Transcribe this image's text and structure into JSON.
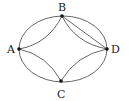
{
  "diagram": {
    "type": "graph",
    "vertices": [
      {
        "id": "A",
        "label": "A",
        "x": 19,
        "y": 49
      },
      {
        "id": "B",
        "label": "B",
        "x": 62,
        "y": 16
      },
      {
        "id": "C",
        "label": "C",
        "x": 61,
        "y": 81
      },
      {
        "id": "D",
        "label": "D",
        "x": 107,
        "y": 49
      }
    ],
    "edges": [
      {
        "from": "A",
        "to": "B",
        "kind": "outer-ellipse-arc"
      },
      {
        "from": "B",
        "to": "D",
        "kind": "outer-ellipse-arc"
      },
      {
        "from": "D",
        "to": "C",
        "kind": "outer-ellipse-arc"
      },
      {
        "from": "C",
        "to": "A",
        "kind": "outer-ellipse-arc"
      },
      {
        "from": "A",
        "to": "B",
        "kind": "inner-concave-arc"
      },
      {
        "from": "B",
        "to": "D",
        "kind": "inner-concave-arc"
      },
      {
        "from": "D",
        "to": "C",
        "kind": "inner-concave-arc"
      },
      {
        "from": "C",
        "to": "A",
        "kind": "inner-concave-arc"
      },
      {
        "from": "B",
        "to": "D",
        "kind": "straight-line"
      }
    ],
    "labels": {
      "A": "A",
      "B": "B",
      "C": "C",
      "D": "D"
    }
  }
}
